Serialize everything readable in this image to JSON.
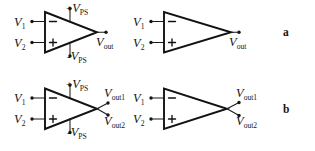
{
  "figure": {
    "background_color": "#ffffff",
    "ink_color": "#141414",
    "panel_labels": [
      {
        "key": "a",
        "text": "a",
        "description": "single-ended output op-amp symbols"
      },
      {
        "key": "b",
        "text": "b",
        "description": "differential output op-amp symbols"
      }
    ],
    "labels": {
      "v1": "V",
      "v1_sub": "1",
      "v2": "V",
      "v2_sub": "2",
      "vout": "V",
      "vout_sub": "out",
      "vout1": "V",
      "vout1_sub": "out1",
      "vout2": "V",
      "vout2_sub": "out2",
      "vps": "V",
      "vps_sub": "PS",
      "plus_sign": "+",
      "minus_sign": "-",
      "inverting_input": "–",
      "noninverting_input": "+"
    },
    "circuits": [
      {
        "id": "a-left",
        "row": "a",
        "variant": "with-power-supply-rails",
        "inputs": [
          "V1",
          "V2"
        ],
        "input_polarity": [
          "inverting",
          "non-inverting"
        ],
        "outputs": [
          "Vout"
        ],
        "supply_pins": [
          "+VPS",
          "-VPS"
        ]
      },
      {
        "id": "a-right",
        "row": "a",
        "variant": "simplified",
        "inputs": [
          "V1",
          "V2"
        ],
        "input_polarity": [
          "inverting",
          "non-inverting"
        ],
        "outputs": [
          "Vout"
        ],
        "supply_pins": []
      },
      {
        "id": "b-left",
        "row": "b",
        "variant": "with-power-supply-rails",
        "inputs": [
          "V1",
          "V2"
        ],
        "input_polarity": [
          "inverting",
          "non-inverting"
        ],
        "outputs": [
          "Vout1",
          "Vout2"
        ],
        "supply_pins": [
          "+VPS",
          "-VPS"
        ]
      },
      {
        "id": "b-right",
        "row": "b",
        "variant": "simplified",
        "inputs": [
          "V1",
          "V2"
        ],
        "input_polarity": [
          "inverting",
          "non-inverting"
        ],
        "outputs": [
          "Vout1",
          "Vout2"
        ],
        "supply_pins": []
      }
    ]
  }
}
